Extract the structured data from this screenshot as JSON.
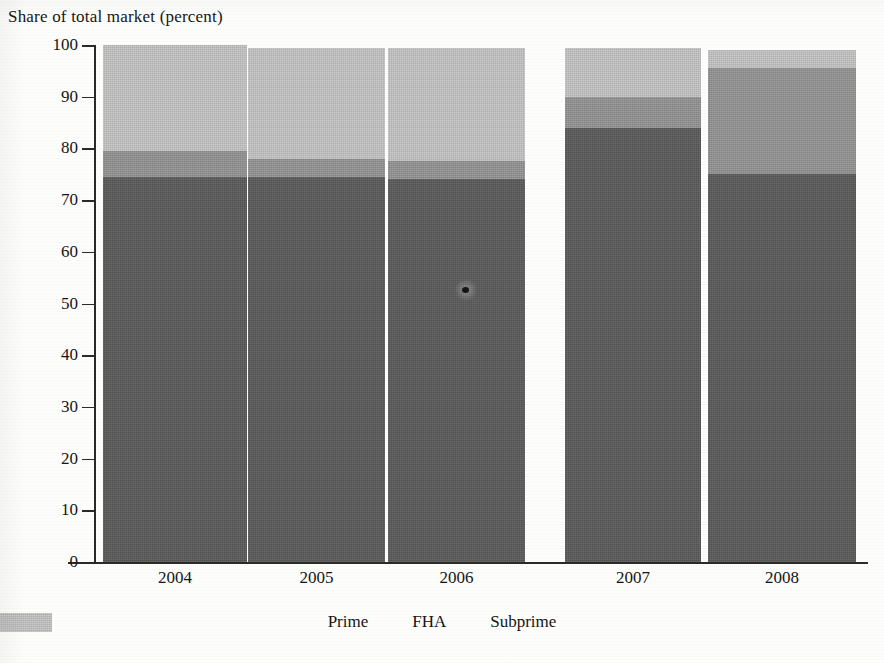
{
  "chart_data": {
    "type": "bar",
    "subtype": "stacked-bar-100percent",
    "title": "Share of total market (percent)",
    "xlabel": "",
    "ylabel": "Share of total market (percent)",
    "categories": [
      "2004",
      "2005",
      "2006",
      "2007",
      "2008"
    ],
    "series": [
      {
        "name": "Prime",
        "color": "#595959",
        "values": [
          74.5,
          74.5,
          74.0,
          84.0,
          75.0
        ]
      },
      {
        "name": "FHA",
        "color": "#919191",
        "values": [
          5.0,
          3.5,
          3.5,
          6.0,
          20.5
        ]
      },
      {
        "name": "Subprime",
        "color": "#bfbfbf",
        "values": [
          20.5,
          21.5,
          22.0,
          9.5,
          3.5
        ]
      }
    ],
    "totals": [
      100,
      99.5,
      99.5,
      99.5,
      99.0
    ],
    "ylim": [
      0,
      100
    ],
    "yticks": [
      0,
      10,
      20,
      30,
      40,
      50,
      60,
      70,
      80,
      90,
      100
    ],
    "ytick_labels": [
      "0",
      "10",
      "20",
      "30",
      "40",
      "50",
      "60",
      "70",
      "80",
      "90",
      "100"
    ],
    "grid": false,
    "legend_position": "bottom",
    "legend_entries": [
      "Prime",
      "FHA",
      "Subprime"
    ]
  },
  "axis": {
    "y_tick_labels": [
      "100",
      "90",
      "80",
      "70",
      "60",
      "50",
      "40",
      "30",
      "20",
      "10",
      "0"
    ],
    "x_tick_labels": [
      "2004",
      "2005",
      "2006",
      "2007",
      "2008"
    ]
  },
  "legend": {
    "items": [
      {
        "label": "Prime",
        "color": "#595959"
      },
      {
        "label": "FHA",
        "color": "#919191"
      },
      {
        "label": "Subprime",
        "color": "#bfbfbf"
      }
    ]
  },
  "colors": {
    "prime": "#595959",
    "fha": "#919191",
    "subprime": "#bfbfbf",
    "axis": "#2a2a2a",
    "text": "#151515",
    "background": "#fdfdfb"
  }
}
